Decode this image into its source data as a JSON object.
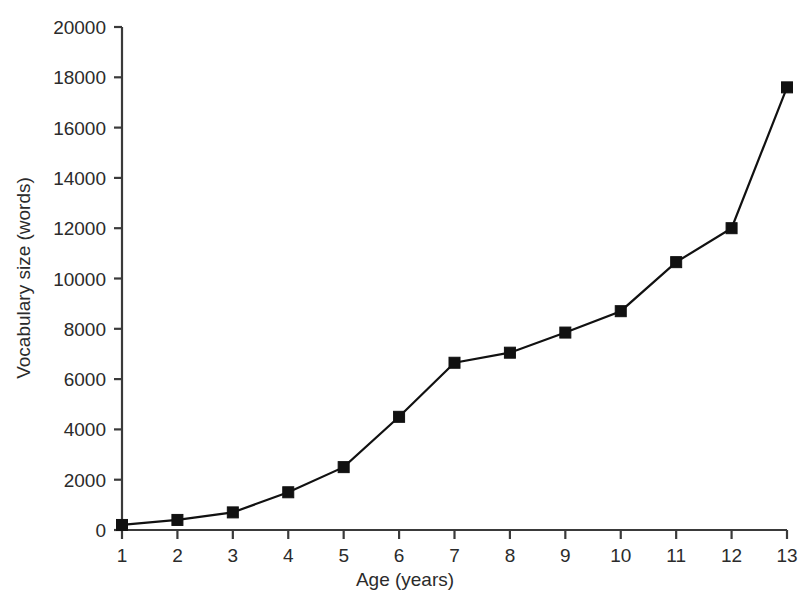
{
  "chart_data": {
    "type": "line",
    "title": "",
    "xlabel": "Age (years)",
    "ylabel": "Vocabulary size (words)",
    "x": [
      1,
      2,
      3,
      4,
      5,
      6,
      7,
      8,
      9,
      10,
      11,
      12,
      13
    ],
    "values": [
      200,
      400,
      700,
      1500,
      2500,
      4500,
      6650,
      7050,
      7850,
      8700,
      10650,
      12000,
      17600
    ],
    "series": [
      {
        "name": "Vocabulary size",
        "values": [
          200,
          400,
          700,
          1500,
          2500,
          4500,
          6650,
          7050,
          7850,
          8700,
          10650,
          12000,
          17600
        ]
      }
    ],
    "xlim": [
      1,
      13
    ],
    "ylim": [
      0,
      20000
    ],
    "x_tick_labels": [
      "1",
      "2",
      "3",
      "4",
      "5",
      "6",
      "7",
      "8",
      "9",
      "10",
      "11",
      "12",
      "13"
    ],
    "y_tick_labels": [
      "0",
      "2000",
      "4000",
      "6000",
      "8000",
      "10000",
      "12000",
      "14000",
      "16000",
      "18000",
      "20000"
    ],
    "y_ticks": [
      0,
      2000,
      4000,
      6000,
      8000,
      10000,
      12000,
      14000,
      16000,
      18000,
      20000
    ],
    "grid": false,
    "legend": null,
    "marker": "square",
    "marker_color": "#111111",
    "line_color": "#111111",
    "axis_color": "#3a3a3a",
    "text_color": "#2b2b2b",
    "background_color": "#ffffff"
  }
}
